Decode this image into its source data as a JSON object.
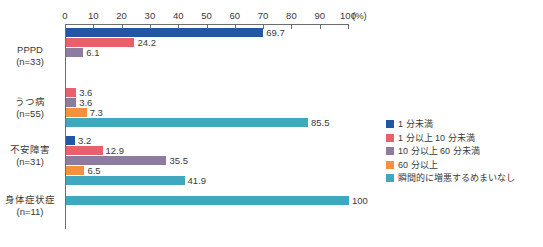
{
  "chart_data": {
    "type": "bar",
    "orientation": "horizontal",
    "grouped": true,
    "title": "",
    "xlabel": "(%)",
    "ylabel": "",
    "xlim": [
      0,
      100
    ],
    "xticks": [
      0,
      10,
      20,
      30,
      40,
      50,
      60,
      70,
      80,
      90,
      100
    ],
    "xtick_labels": [
      "0",
      "10",
      "20",
      "30",
      "40",
      "50",
      "60",
      "70",
      "80",
      "90",
      "100"
    ],
    "unit_label": "(%)",
    "grid": false,
    "legend_position": "right",
    "categories": [
      "PPPD",
      "うつ病",
      "不安障害",
      "身体症状症"
    ],
    "category_lines": [
      [
        "PPPD",
        "(n=33)"
      ],
      [
        "うつ病",
        "(n=55)"
      ],
      [
        "不安障害",
        "(n=31)"
      ],
      [
        "身体症状症",
        "(n=11)"
      ]
    ],
    "series": [
      {
        "name": "1 分未満",
        "color": "#2356a4",
        "values": [
          69.7,
          null,
          3.2,
          null
        ],
        "labels": [
          "69.7",
          "",
          "3.2",
          ""
        ]
      },
      {
        "name": "1 分以上 10 分未満",
        "color": "#e8606a",
        "values": [
          24.2,
          3.6,
          12.9,
          null
        ],
        "labels": [
          "24.2",
          "3.6",
          "12.9",
          ""
        ]
      },
      {
        "name": "10 分以上 60 分未満",
        "color": "#8d7ba0",
        "values": [
          6.1,
          3.6,
          35.5,
          null
        ],
        "labels": [
          "6.1",
          "3.6",
          "35.5",
          ""
        ]
      },
      {
        "name": "60 分以上",
        "color": "#f5913e",
        "values": [
          null,
          7.3,
          6.5,
          null
        ],
        "labels": [
          "",
          "7.3",
          "6.5",
          ""
        ]
      },
      {
        "name": "瞬間的に増悪するめまいなし",
        "color": "#3fa8bf",
        "values": [
          null,
          85.5,
          41.9,
          100
        ],
        "labels": [
          "",
          "85.5",
          "41.9",
          "100"
        ]
      }
    ]
  },
  "legend": {
    "items": [
      {
        "label": "1 分未満",
        "color": "#2356a4"
      },
      {
        "label": "1 分以上 10 分未満",
        "color": "#e8606a"
      },
      {
        "label": "10 分以上 60 分未満",
        "color": "#8d7ba0"
      },
      {
        "label": "60 分以上",
        "color": "#f5913e"
      },
      {
        "label": "瞬間的に増悪するめまいなし",
        "color": "#3fa8bf"
      }
    ]
  },
  "axis": {
    "origin_x": 65,
    "pixels_per_percent": 2.83,
    "line_color": "#6d6d6d"
  },
  "groups_layout": [
    {
      "top": 28,
      "label_top": 44
    },
    {
      "top": 88,
      "label_top": 96
    },
    {
      "top": 136,
      "label_top": 144
    },
    {
      "top": 196,
      "label_top": 194
    }
  ]
}
